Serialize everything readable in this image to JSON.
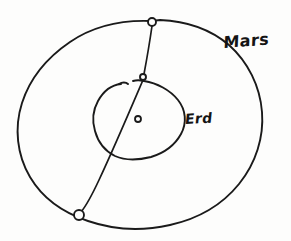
{
  "figure": {
    "kind": "hand-drawn-sketch",
    "medium": "pen on paper",
    "background_color": "#fdfdfc",
    "ink_color": "#1a1a1a",
    "width": 291,
    "height": 241
  },
  "labels": {
    "mars": "Mars",
    "earth": "Erd"
  },
  "shapes": {
    "outer_orbit": {
      "name": "mars-orbit",
      "description": "large hand-drawn circle",
      "center": [
        136,
        122
      ],
      "radius_x": 118,
      "radius_y": 112
    },
    "inner_orbit": {
      "name": "earth-orbit",
      "description": "small irregular closed oval with a small gap at upper left",
      "center": [
        137,
        120
      ],
      "radius_x": 45,
      "radius_y": 38
    },
    "sight_line": {
      "name": "sight-line",
      "description": "straight line from marker on outer circle through inner orbit to opposite marker on outer circle",
      "from": [
        152,
        22
      ],
      "to": [
        78,
        215
      ]
    }
  },
  "markers": [
    {
      "name": "marker-top",
      "label": "",
      "cx": 152,
      "cy": 22,
      "r": 4
    },
    {
      "name": "marker-junction",
      "label": "",
      "cx": 143,
      "cy": 77,
      "r": 3
    },
    {
      "name": "marker-bottom-left",
      "label": "",
      "cx": 79,
      "cy": 215,
      "r": 5
    },
    {
      "name": "marker-center-sun",
      "label": "",
      "cx": 138,
      "cy": 119,
      "r": 3
    }
  ]
}
